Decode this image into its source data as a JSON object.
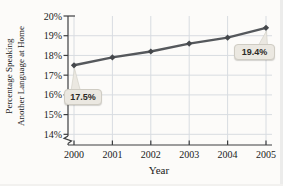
{
  "figure": {
    "y_axis_title_line1": "Percentage Speaking",
    "y_axis_title_line2": "Another Language at Home",
    "x_axis_title": "Year",
    "callouts": [
      {
        "label": "17.5%",
        "year": 2000
      },
      {
        "label": "19.4%",
        "year": 2005
      }
    ]
  },
  "chart_data": {
    "type": "line",
    "x": [
      2000,
      2001,
      2002,
      2003,
      2004,
      2005
    ],
    "x_tick_labels": [
      "2000",
      "2001",
      "2002",
      "2003",
      "2004",
      "2005"
    ],
    "values": [
      17.5,
      17.9,
      18.2,
      18.6,
      18.9,
      19.4
    ],
    "y_ticks": [
      20,
      19,
      18,
      17,
      16,
      15,
      14
    ],
    "y_tick_labels": [
      "20%",
      "19%",
      "18%",
      "17%",
      "16%",
      "15%",
      "14%"
    ],
    "ylim": [
      14,
      20
    ],
    "axis_break": true,
    "title": "",
    "xlabel": "Year",
    "ylabel": "Percentage Speaking Another Language at Home",
    "grid": true,
    "legend": false,
    "annotations": [
      "17.5%",
      "19.4%"
    ],
    "line_color": "#55585c",
    "marker_color": "#45484c",
    "grid_color": "#d8dce1",
    "axis_color": "#3c3e40",
    "callout_fill": "#ebe8e1",
    "text_color": "#1a1a1a"
  }
}
